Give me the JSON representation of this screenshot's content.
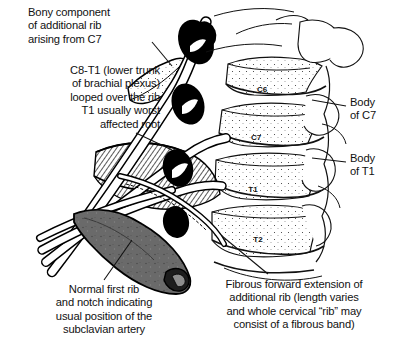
{
  "figure": {
    "background_color": "#ffffff",
    "ink_color": "#000000",
    "rib_shade_color": "#6a6a6a",
    "nerve_root_color": "#000000"
  },
  "annotations": {
    "bony_component": "Bony component\nof additional rib\narising from C7",
    "lower_trunk": "C8-T1 (lower trunk\nof brachial plexus)\nlooped over the rib\nT1 usually worst\naffected root",
    "body_of_c7": "Body\nof C7",
    "body_of_t1": "Body\nof T1",
    "normal_first_rib": "Normal first rib\nand notch indicating\nusual position of the\nsubclavian artery",
    "fibrous_extension": "Fibrous forward extension of\nadditional rib (length varies\nand whole cervical “rib” may\nconsist of a fibrous band)"
  },
  "vertebra_labels": [
    {
      "name": "C6",
      "text": "C6",
      "x": 262,
      "y": 92
    },
    {
      "name": "C7",
      "text": "C7",
      "x": 256,
      "y": 140
    },
    {
      "name": "T1",
      "text": "T1",
      "x": 253,
      "y": 192
    },
    {
      "name": "T2",
      "text": "T2",
      "x": 258,
      "y": 242
    }
  ]
}
